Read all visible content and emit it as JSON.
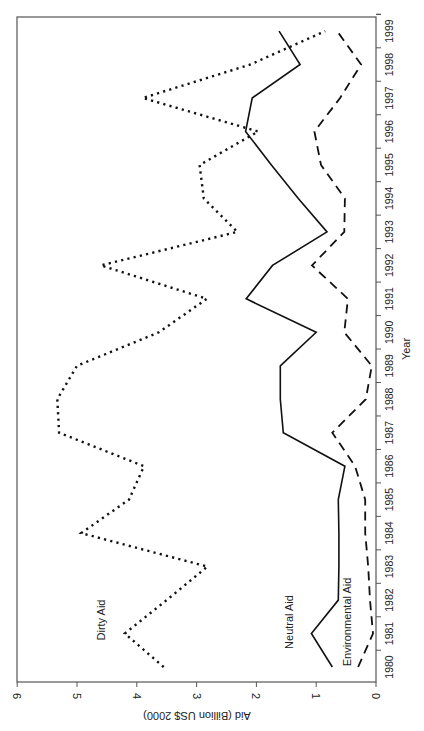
{
  "chart_data": {
    "type": "line",
    "orientation": "rotated-90-clockwise",
    "title": "",
    "xlabel": "Year",
    "ylabel": "Aid (Billion US$ 2000)",
    "ylim": [
      0,
      6
    ],
    "yticks": [
      0,
      1,
      2,
      3,
      4,
      5,
      6
    ],
    "grid": false,
    "categories": [
      "1980",
      "1981",
      "1982",
      "1983",
      "1984",
      "1985",
      "1986",
      "1987",
      "1988",
      "1989",
      "1990",
      "1991",
      "1992",
      "1993",
      "1994",
      "1995",
      "1996",
      "1997",
      "1998",
      "1999"
    ],
    "series": [
      {
        "name": "Dirty Aid",
        "style": "dotted",
        "values": [
          3.55,
          4.2,
          3.5,
          2.82,
          4.93,
          4.13,
          3.88,
          5.3,
          5.33,
          5.0,
          3.63,
          2.83,
          4.6,
          2.32,
          2.88,
          2.95,
          1.97,
          3.9,
          2.1,
          0.85
        ]
      },
      {
        "name": "Neutral Aid",
        "style": "solid",
        "values": [
          0.73,
          1.08,
          0.63,
          0.62,
          0.62,
          0.63,
          0.52,
          1.55,
          1.6,
          1.6,
          1.0,
          2.17,
          1.73,
          0.82,
          1.3,
          1.75,
          2.18,
          2.07,
          1.27,
          1.62
        ]
      },
      {
        "name": "Environmental Aid",
        "style": "dashed",
        "values": [
          0.3,
          0.05,
          0.1,
          0.13,
          0.18,
          0.18,
          0.35,
          0.73,
          0.17,
          0.07,
          0.53,
          0.47,
          1.07,
          0.53,
          0.52,
          0.92,
          1.03,
          0.6,
          0.25,
          0.65
        ]
      }
    ],
    "annotations": [
      {
        "text": "Dirty Aid",
        "series": "Dirty Aid"
      },
      {
        "text": "Neutral Aid",
        "series": "Neutral Aid"
      },
      {
        "text": "Environmental Aid",
        "series": "Environmental Aid"
      }
    ]
  }
}
